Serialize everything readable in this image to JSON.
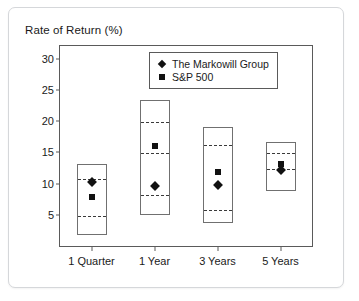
{
  "chart_data": {
    "type": "box",
    "title": "Rate of Return (%)",
    "xlabel": "",
    "ylabel": "Rate of Return (%)",
    "categories": [
      "1 Quarter",
      "1 Year",
      "3 Years",
      "5 Years"
    ],
    "ylim": [
      0,
      32
    ],
    "yticks": [
      5,
      10,
      15,
      20,
      25,
      30
    ],
    "ytick_labels": [
      "5",
      "10",
      "15",
      "20",
      "25",
      "30"
    ],
    "grid": false,
    "legend_position": "top-right",
    "legend": [
      {
        "label": "The Markowill Group",
        "marker": "diamond",
        "color": "#111111"
      },
      {
        "label": "S&P 500",
        "marker": "square",
        "color": "#111111"
      }
    ],
    "boxes": [
      {
        "category": "1 Quarter",
        "top": 13.2,
        "upper_dash": 10.9,
        "lower_dash": 5.0,
        "bottom": 1.7
      },
      {
        "category": "1 Year",
        "top": 23.3,
        "upper_dash": 20.0,
        "lower_dash": 15.0,
        "mid_dash": 8.4,
        "bottom": 4.9
      },
      {
        "category": "3 Years",
        "top": 19.1,
        "upper_dash": 16.3,
        "lower_dash": 6.0,
        "bottom": 3.7
      },
      {
        "category": "5 Years",
        "top": 16.6,
        "upper_dash": 15.0,
        "lower_dash": 12.5,
        "bottom": 8.8
      }
    ],
    "series": [
      {
        "name": "The Markowill Group",
        "marker": "diamond",
        "values": [
          10.2,
          9.6,
          9.7,
          12.1
        ]
      },
      {
        "name": "S&P 500",
        "marker": "square",
        "values": [
          7.8,
          16.0,
          11.9,
          13.1
        ]
      }
    ]
  }
}
